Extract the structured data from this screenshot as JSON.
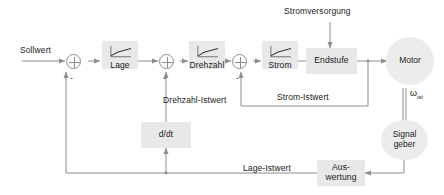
{
  "diagram": {
    "style": {
      "wire_color": "#8d8d8d",
      "block_fill": "#e8e8e8",
      "ellipse_fill": "#ececec",
      "text_color": "#1a1a1a",
      "background": "#ffffff"
    },
    "blocks": [
      {
        "id": "lage",
        "label": "Lage",
        "icon": "saturation-curve-icon"
      },
      {
        "id": "drehzahl",
        "label": "Drehzahl",
        "icon": "saturation-curve-icon"
      },
      {
        "id": "strom",
        "label": "Strom",
        "icon": "saturation-curve-icon"
      },
      {
        "id": "endstufe",
        "label": "Endstufe",
        "icon": null
      },
      {
        "id": "ddt",
        "label": "d/dt",
        "icon": null
      },
      {
        "id": "auswertung",
        "label": "Aus-\nwertung",
        "icon": null
      }
    ],
    "block_labels": {
      "lage": "Lage",
      "drehzahl": "Drehzahl",
      "strom": "Strom",
      "endstufe": "Endstufe",
      "ddt": "d/dt",
      "auswertung_line1": "Aus-",
      "auswertung_line2": "wertung"
    },
    "round_nodes": {
      "motor": "Motor",
      "signalgeber_line1": "Signal",
      "signalgeber_line2": "geber"
    },
    "signal_labels": {
      "sollwert": "Sollwert",
      "stromversorgung": "Stromversorgung",
      "drehzahl_istwert": "Drehzahl-Istwert",
      "strom_istwert": "Strom-Istwert",
      "lage_istwert": "Lage-Istwert",
      "omega_symbol": "ω",
      "omega_subscript": "ist"
    },
    "summing_junctions": [
      {
        "id": "sum-position",
        "operator": "plus-circle",
        "feedback_sign": "-"
      },
      {
        "id": "sum-speed",
        "operator": "plus-circle",
        "feedback_sign": "-"
      },
      {
        "id": "sum-current",
        "operator": "plus-circle",
        "feedback_sign": "-"
      }
    ],
    "sign_marks": {
      "minus": "-"
    }
  }
}
